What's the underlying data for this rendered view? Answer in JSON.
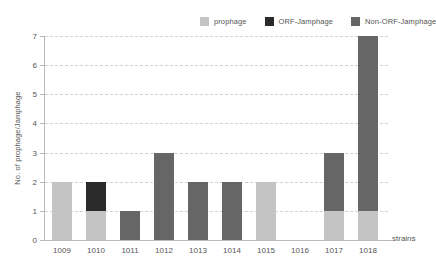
{
  "chart_data": {
    "type": "bar",
    "title": "",
    "subtitle": "",
    "xlabel": "strains",
    "ylabel": "No. of prophage/Jamphage",
    "ylim": [
      0,
      7
    ],
    "ytick_labels": [
      "0",
      "1",
      "2",
      "3",
      "4",
      "5",
      "6",
      "7"
    ],
    "grid": true,
    "stacked": true,
    "legend_position": "top-right",
    "categories": [
      "1009",
      "1010",
      "1011",
      "1012",
      "1013",
      "1014",
      "1015",
      "1016",
      "1017",
      "1018"
    ],
    "series": [
      {
        "name": "prophage",
        "color": "#c4c4c4",
        "values": [
          2,
          1,
          0,
          0,
          0,
          0,
          2,
          0,
          1,
          1
        ]
      },
      {
        "name": "ORF-Jamphage",
        "color": "#2b2b2b",
        "values": [
          0,
          1,
          0,
          0,
          0,
          0,
          0,
          0,
          0,
          0
        ]
      },
      {
        "name": "Non-ORF-Jamphage",
        "color": "#666666",
        "values": [
          0,
          0,
          1,
          3,
          2,
          2,
          0,
          0,
          2,
          6
        ]
      }
    ],
    "totals": [
      2,
      2,
      1,
      3,
      2,
      2,
      2,
      0,
      3,
      7
    ]
  },
  "legend": {
    "items": [
      {
        "label": "prophage",
        "color": "#c4c4c4",
        "swatch_name": "legend-swatch-prophage"
      },
      {
        "label": "ORF-Jamphage",
        "color": "#2b2b2b",
        "swatch_name": "legend-swatch-orf-jamphage"
      },
      {
        "label": "Non-ORF-Jamphage",
        "color": "#666666",
        "swatch_name": "legend-swatch-non-orf-jamphage"
      }
    ]
  },
  "axes": {
    "y_title": "No. of prophage/Jamphage",
    "x_title": "strains"
  }
}
